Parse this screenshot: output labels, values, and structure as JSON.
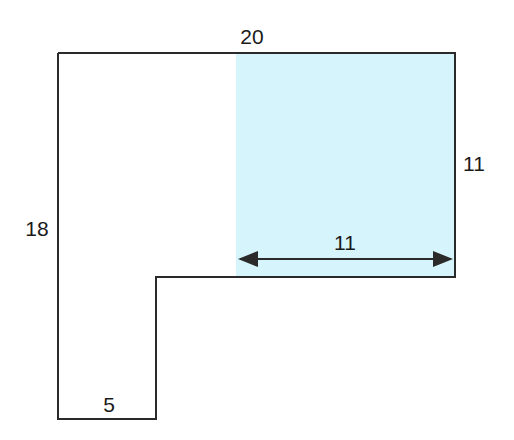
{
  "diagram": {
    "type": "composite-shape-area",
    "shape": "L-shaped polygon",
    "shaded_region": {
      "color": "#d6f4fb",
      "width": 11,
      "height": 11
    },
    "labels": {
      "top": "20",
      "left": "18",
      "right": "11",
      "shaded_width": "11",
      "bottom": "5"
    },
    "colors": {
      "outline": "#2a2a2a",
      "fill": "#d6f4fb",
      "arrow": "#2a2a2a"
    }
  }
}
